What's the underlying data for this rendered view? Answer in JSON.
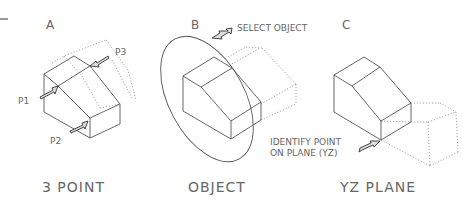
{
  "figures": [
    {
      "letter": "A",
      "caption": "3 POINT",
      "callouts": [
        "P1",
        "P2",
        "P3"
      ]
    },
    {
      "letter": "B",
      "caption": "OBJECT",
      "callouts": [
        "SELECT OBJECT"
      ]
    },
    {
      "letter": "C",
      "caption": "YZ PLANE",
      "callouts": [
        "IDENTIFY POINT",
        "ON PLANE (YZ)"
      ]
    }
  ],
  "colors": {
    "line": "#555555",
    "hidden_line": "#999999",
    "text": "#666666"
  }
}
